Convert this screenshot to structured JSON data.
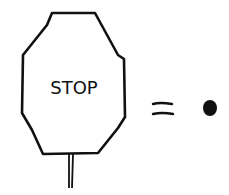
{
  "diagram": {
    "sign_text": "STOP",
    "relation": "equals",
    "result": "period / dot",
    "colors": {
      "stroke": "#111111",
      "background": "#ffffff"
    }
  }
}
